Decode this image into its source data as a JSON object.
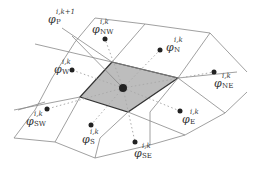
{
  "diagram": {
    "colors": {
      "line": "#777777",
      "shade": "#bdbdbd",
      "outline": "#333333",
      "dot": "#222222",
      "dotted": "#aaaaaa"
    },
    "center": {
      "symbol": "φ",
      "sup": "i,k+1",
      "sub": "P"
    },
    "neighbors": [
      {
        "id": "NW",
        "symbol": "φ",
        "sup": "i,k",
        "sub": "NW"
      },
      {
        "id": "N",
        "symbol": "φ",
        "sup": "i,k",
        "sub": "N"
      },
      {
        "id": "W",
        "symbol": "φ",
        "sup": "i,k",
        "sub": "W"
      },
      {
        "id": "NE",
        "symbol": "φ",
        "sup": "i,k",
        "sub": "NE"
      },
      {
        "id": "SW",
        "symbol": "φ",
        "sup": "i,k",
        "sub": "SW"
      },
      {
        "id": "E",
        "symbol": "φ",
        "sup": "i,k",
        "sub": "E"
      },
      {
        "id": "S",
        "symbol": "φ",
        "sup": "i,k",
        "sub": "S"
      },
      {
        "id": "SE",
        "symbol": "φ",
        "sup": "i,k",
        "sub": "SE"
      }
    ]
  }
}
